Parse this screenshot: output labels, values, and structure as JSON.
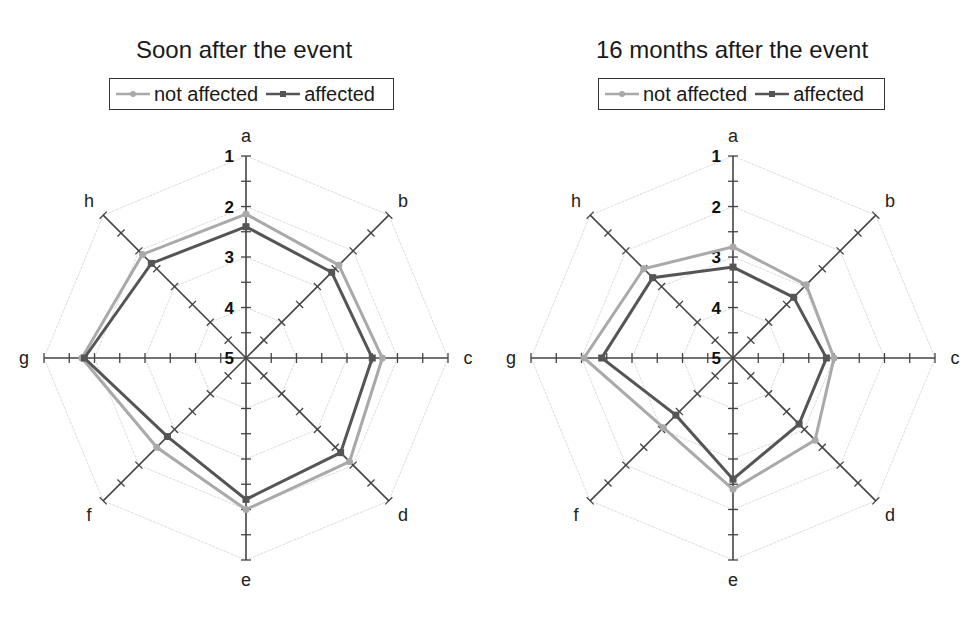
{
  "colors": {
    "not_affected": "#a9a9a9",
    "affected": "#555555",
    "axis": "#444444",
    "grid": "#dcdcdc"
  },
  "chart_data": [
    {
      "type": "radar",
      "title": "Soon after the event",
      "axes": [
        "a",
        "b",
        "c",
        "d",
        "e",
        "f",
        "g",
        "h"
      ],
      "scale": {
        "center_value": 5,
        "outer_value": 1,
        "tick_labels": [
          "1",
          "2",
          "3",
          "4",
          "5"
        ],
        "minor_step": 0.5,
        "reversed": true
      },
      "legend": {
        "position": "top",
        "entries": [
          "not affected",
          "affected"
        ]
      },
      "series": [
        {
          "name": "not affected",
          "marker": "circle",
          "values": [
            2.15,
            2.4,
            2.3,
            2.1,
            2.0,
            2.5,
            1.75,
            2.1
          ]
        },
        {
          "name": "affected",
          "marker": "square",
          "values": [
            2.4,
            2.6,
            2.5,
            2.35,
            2.2,
            2.8,
            1.8,
            2.35
          ]
        }
      ],
      "grid": true
    },
    {
      "type": "radar",
      "title": "16 months after the event",
      "axes": [
        "a",
        "b",
        "c",
        "d",
        "e",
        "f",
        "g",
        "h"
      ],
      "scale": {
        "center_value": 5,
        "outer_value": 1,
        "tick_labels": [
          "1",
          "2",
          "3",
          "4",
          "5"
        ],
        "minor_step": 0.5,
        "reversed": true
      },
      "legend": {
        "position": "top",
        "entries": [
          "not affected",
          "affected"
        ]
      },
      "series": [
        {
          "name": "not affected",
          "marker": "circle",
          "values": [
            2.8,
            2.95,
            3.0,
            2.7,
            2.4,
            3.05,
            2.05,
            2.5
          ]
        },
        {
          "name": "affected",
          "marker": "square",
          "values": [
            3.2,
            3.3,
            3.15,
            3.15,
            2.6,
            3.4,
            2.4,
            2.75
          ]
        }
      ],
      "grid": true
    }
  ],
  "panels": [
    {
      "title": "Soon after the event",
      "legend": {
        "not_affected_label": "not affected",
        "affected_label": "affected"
      }
    },
    {
      "title": "16 months after the event",
      "legend": {
        "not_affected_label": "not affected",
        "affected_label": "affected"
      }
    }
  ]
}
